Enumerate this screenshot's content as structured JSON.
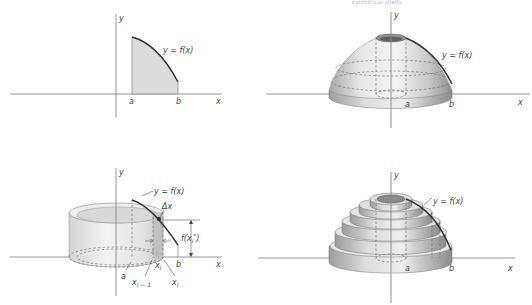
{
  "caption_top": "cylindrical shells",
  "colors": {
    "background": "#ffffff",
    "axis": "#888888",
    "curve": "#333333",
    "region_fill": "#dcdcdc",
    "solid_light": "#f2f2f2",
    "solid_mid": "#cfcfcf",
    "solid_dark": "#9a9a9a"
  },
  "panels": [
    {
      "id": "region",
      "axis_x_label": "x",
      "axis_y_label": "y",
      "curve_label": "y = f(x)",
      "a_label": "a",
      "b_label": "b"
    },
    {
      "id": "solid-of-revolution",
      "axis_x_label": "x",
      "axis_y_label": "y",
      "curve_label": "y = f(x)",
      "a_label": "a",
      "b_label": "b"
    },
    {
      "id": "single-shell",
      "axis_x_label": "x",
      "axis_y_label": "y",
      "curve_label": "y = f(x)",
      "a_label": "a",
      "b_label": "b",
      "delta_label": "Δx",
      "height_label": "f(x",
      "height_sub": "i",
      "height_sup": "*",
      "height_close": ")",
      "xi_star": "x",
      "xi_star_sub": "i",
      "xi_star_sup": "*",
      "x_i_minus_1": "x",
      "x_i_minus_1_sub": "i − 1",
      "x_i": "x",
      "x_i_sub": "i"
    },
    {
      "id": "stacked-shells",
      "axis_x_label": "x",
      "axis_y_label": "y",
      "curve_label": "y = f(x)",
      "a_label": "a",
      "b_label": "b",
      "shell_count": 6
    }
  ]
}
